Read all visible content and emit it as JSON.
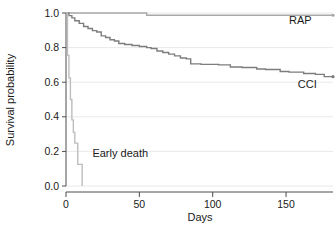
{
  "chart_data": {
    "type": "line",
    "title": "",
    "subtitle": "",
    "xlabel": "Days",
    "ylabel": "Survival probability",
    "xlim": [
      0,
      182
    ],
    "ylim": [
      0.0,
      1.0
    ],
    "xticks": [
      0,
      50,
      100,
      150
    ],
    "xtick_labels": [
      "0",
      "50",
      "100",
      "150"
    ],
    "yticks": [
      0.0,
      0.2,
      0.4,
      0.6,
      0.8,
      1.0
    ],
    "ytick_labels": [
      "0.0",
      "0.2",
      "0.4",
      "0.6",
      "0.8",
      "1.0"
    ],
    "grid": true,
    "grid_axis": "y",
    "legend_position": "inline-annotations",
    "curve_style": "step-post (Kaplan-Meier survival)",
    "series": [
      {
        "name": "RAP",
        "label": "RAP",
        "color": "#a8a8a8",
        "label_x": 152,
        "label_y": 0.935,
        "points": [
          [
            0,
            1.0
          ],
          [
            55,
            1.0
          ],
          [
            55,
            0.987
          ],
          [
            182,
            0.987
          ]
        ]
      },
      {
        "name": "CCI",
        "label": "CCI",
        "color": "#7d7d7d",
        "label_x": 158,
        "label_y": 0.565,
        "points": [
          [
            0,
            1.0
          ],
          [
            2,
            1.0
          ],
          [
            2,
            0.985
          ],
          [
            4,
            0.985
          ],
          [
            4,
            0.972
          ],
          [
            6,
            0.972
          ],
          [
            6,
            0.955
          ],
          [
            9,
            0.955
          ],
          [
            9,
            0.94
          ],
          [
            12,
            0.94
          ],
          [
            12,
            0.922
          ],
          [
            15,
            0.922
          ],
          [
            15,
            0.91
          ],
          [
            18,
            0.91
          ],
          [
            18,
            0.898
          ],
          [
            21,
            0.898
          ],
          [
            21,
            0.89
          ],
          [
            24,
            0.89
          ],
          [
            24,
            0.868
          ],
          [
            27,
            0.868
          ],
          [
            27,
            0.858
          ],
          [
            30,
            0.858
          ],
          [
            30,
            0.845
          ],
          [
            33,
            0.845
          ],
          [
            33,
            0.838
          ],
          [
            36,
            0.838
          ],
          [
            36,
            0.824
          ],
          [
            40,
            0.824
          ],
          [
            40,
            0.818
          ],
          [
            45,
            0.818
          ],
          [
            45,
            0.812
          ],
          [
            50,
            0.812
          ],
          [
            50,
            0.806
          ],
          [
            55,
            0.806
          ],
          [
            55,
            0.8
          ],
          [
            58,
            0.8
          ],
          [
            58,
            0.795
          ],
          [
            62,
            0.795
          ],
          [
            62,
            0.78
          ],
          [
            66,
            0.78
          ],
          [
            66,
            0.772
          ],
          [
            70,
            0.772
          ],
          [
            70,
            0.762
          ],
          [
            74,
            0.762
          ],
          [
            74,
            0.752
          ],
          [
            78,
            0.752
          ],
          [
            78,
            0.74
          ],
          [
            82,
            0.74
          ],
          [
            82,
            0.735
          ],
          [
            85,
            0.735
          ],
          [
            85,
            0.706
          ],
          [
            92,
            0.706
          ],
          [
            92,
            0.703
          ],
          [
            104,
            0.703
          ],
          [
            104,
            0.7
          ],
          [
            112,
            0.7
          ],
          [
            112,
            0.688
          ],
          [
            120,
            0.688
          ],
          [
            120,
            0.685
          ],
          [
            130,
            0.685
          ],
          [
            130,
            0.676
          ],
          [
            136,
            0.676
          ],
          [
            136,
            0.673
          ],
          [
            146,
            0.673
          ],
          [
            146,
            0.662
          ],
          [
            152,
            0.662
          ],
          [
            152,
            0.658
          ],
          [
            162,
            0.658
          ],
          [
            162,
            0.65
          ],
          [
            170,
            0.65
          ],
          [
            170,
            0.645
          ],
          [
            176,
            0.645
          ],
          [
            176,
            0.632
          ],
          [
            182,
            0.632
          ]
        ]
      },
      {
        "name": "Early death",
        "label": "Early death",
        "color": "#bdbdbd",
        "label_x": 18,
        "label_y": 0.168,
        "points": [
          [
            0,
            1.0
          ],
          [
            1,
            1.0
          ],
          [
            1,
            0.755
          ],
          [
            2,
            0.755
          ],
          [
            2,
            0.625
          ],
          [
            3,
            0.625
          ],
          [
            3,
            0.5
          ],
          [
            4,
            0.5
          ],
          [
            4,
            0.382
          ],
          [
            5,
            0.382
          ],
          [
            5,
            0.31
          ],
          [
            6,
            0.31
          ],
          [
            6,
            0.248
          ],
          [
            8,
            0.248
          ],
          [
            8,
            0.125
          ],
          [
            11,
            0.125
          ],
          [
            11,
            0.0
          ]
        ]
      }
    ],
    "censor_marks": [
      {
        "series": "RAP",
        "x": 182,
        "y": 0.987
      },
      {
        "series": "CCI",
        "x": 182,
        "y": 0.632
      }
    ]
  },
  "axes": {
    "ylabel_text": "Survival probability",
    "xlabel_text": "Days"
  }
}
